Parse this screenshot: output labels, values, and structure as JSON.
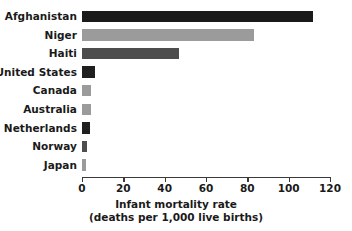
{
  "chart_data": {
    "type": "bar",
    "orientation": "horizontal",
    "title": "",
    "xlabel": "Infant mortality rate",
    "xlabel_line2": "(deaths per 1,000 live births)",
    "ylabel": "",
    "categories": [
      "Afghanistan",
      "Niger",
      "Haiti",
      "United States",
      "Canada",
      "Australia",
      "Netherlands",
      "Norway",
      "Japan"
    ],
    "values": [
      112,
      83,
      47,
      6.3,
      4.4,
      4.3,
      3.8,
      2.5,
      2.0
    ],
    "bar_colors": [
      "#1a1a1a",
      "#9b9b9b",
      "#4d4d4d",
      "#1f1f1f",
      "#9b9b9b",
      "#9b9b9b",
      "#1f1f1f",
      "#4d4d4d",
      "#9b9b9b"
    ],
    "xlim": [
      0,
      120
    ],
    "xticks": [
      0,
      20,
      40,
      60,
      80,
      100,
      120
    ],
    "xtick_labels": [
      "0",
      "20",
      "40",
      "60",
      "80",
      "100",
      "120"
    ],
    "grid": false,
    "legend": null,
    "axis_color": "#3a3a3a",
    "background": "#ffffff"
  }
}
